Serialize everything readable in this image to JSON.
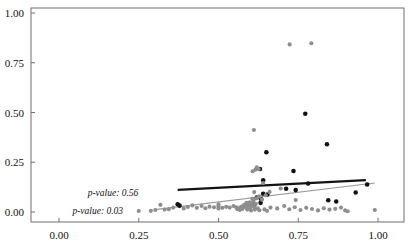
{
  "chart_data": {
    "type": "scatter",
    "title": "",
    "subtitle": "",
    "xlabel": "",
    "ylabel": "",
    "xlim": [
      -0.06,
      1.09
    ],
    "ylim": [
      -0.035,
      1.07
    ],
    "grid": false,
    "legend": "none",
    "x_ticks": [
      0.0,
      0.25,
      0.5,
      0.75,
      1.0
    ],
    "y_ticks": [
      0.0,
      0.25,
      0.5,
      0.75,
      1.0
    ],
    "x_tick_labels": [
      "0.00",
      "0.25",
      "0.50",
      "0.75",
      "1.00"
    ],
    "y_tick_labels": [
      "0.00",
      "0.25",
      "0.50",
      "0.75",
      "1.00"
    ],
    "colors": {
      "series_black": "#121212",
      "series_gray": "#8e8e8e",
      "fit_black": "#151515",
      "fit_gray": "#9a9a9a",
      "frame": "#6f6f6f",
      "text": "#101010",
      "background": "#ffffff"
    },
    "series": [
      {
        "name": "black-points",
        "marker": "circle",
        "color": "#121212",
        "size": 3.3,
        "points": [
          [
            0.65,
            0.3
          ],
          [
            0.772,
            0.494
          ],
          [
            0.84,
            0.34
          ],
          [
            0.735,
            0.206
          ],
          [
            0.63,
            0.216
          ],
          [
            0.64,
            0.159
          ],
          [
            0.781,
            0.143
          ],
          [
            0.966,
            0.138
          ],
          [
            0.712,
            0.117
          ],
          [
            0.742,
            0.11
          ],
          [
            0.93,
            0.098
          ],
          [
            0.64,
            0.092
          ],
          [
            0.653,
            0.088
          ],
          [
            0.62,
            0.073
          ],
          [
            0.634,
            0.064
          ],
          [
            0.844,
            0.059
          ],
          [
            0.869,
            0.053
          ],
          [
            0.632,
            0.046
          ],
          [
            0.603,
            0.04
          ],
          [
            0.612,
            0.036
          ],
          [
            0.585,
            0.032
          ],
          [
            0.372,
            0.039
          ],
          [
            0.378,
            0.032
          ],
          [
            0.593,
            0.028
          ],
          [
            0.573,
            0.022
          ]
        ]
      },
      {
        "name": "gray-points",
        "marker": "circle",
        "color": "#8e8e8e",
        "size": 3.0,
        "points": [
          [
            0.723,
            0.842
          ],
          [
            0.791,
            0.848
          ],
          [
            0.611,
            0.412
          ],
          [
            0.62,
            0.224
          ],
          [
            0.607,
            0.205
          ],
          [
            0.616,
            0.213
          ],
          [
            0.626,
            0.216
          ],
          [
            0.64,
            0.146
          ],
          [
            0.695,
            0.118
          ],
          [
            0.66,
            0.101
          ],
          [
            0.612,
            0.1
          ],
          [
            0.648,
            0.084
          ],
          [
            0.628,
            0.079
          ],
          [
            0.619,
            0.069
          ],
          [
            0.606,
            0.066
          ],
          [
            0.636,
            0.062
          ],
          [
            0.742,
            0.06
          ],
          [
            0.61,
            0.056
          ],
          [
            0.598,
            0.049
          ],
          [
            0.588,
            0.046
          ],
          [
            0.604,
            0.044
          ],
          [
            0.617,
            0.041
          ],
          [
            0.585,
            0.038
          ],
          [
            0.596,
            0.035
          ],
          [
            0.578,
            0.033
          ],
          [
            0.608,
            0.03
          ],
          [
            0.591,
            0.028
          ],
          [
            0.582,
            0.025
          ],
          [
            0.571,
            0.026
          ],
          [
            0.6,
            0.022
          ],
          [
            0.613,
            0.021
          ],
          [
            0.623,
            0.019
          ],
          [
            0.565,
            0.02
          ],
          [
            0.556,
            0.024
          ],
          [
            0.547,
            0.03
          ],
          [
            0.535,
            0.022
          ],
          [
            0.524,
            0.026
          ],
          [
            0.512,
            0.021
          ],
          [
            0.5,
            0.028
          ],
          [
            0.5,
            0.018
          ],
          [
            0.5,
            0.038
          ],
          [
            0.486,
            0.024
          ],
          [
            0.472,
            0.027
          ],
          [
            0.459,
            0.019
          ],
          [
            0.447,
            0.03
          ],
          [
            0.432,
            0.021
          ],
          [
            0.418,
            0.033
          ],
          [
            0.404,
            0.025
          ],
          [
            0.391,
            0.018
          ],
          [
            0.358,
            0.022
          ],
          [
            0.344,
            0.014
          ],
          [
            0.331,
            0.012
          ],
          [
            0.318,
            0.036
          ],
          [
            0.302,
            0.01
          ],
          [
            0.288,
            0.006
          ],
          [
            0.25,
            0.005
          ],
          [
            0.663,
            0.022
          ],
          [
            0.684,
            0.018
          ],
          [
            0.706,
            0.03
          ],
          [
            0.722,
            0.014
          ],
          [
            0.739,
            0.024
          ],
          [
            0.757,
            0.01
          ],
          [
            0.775,
            0.021
          ],
          [
            0.793,
            0.015
          ],
          [
            0.812,
            0.008
          ],
          [
            0.83,
            0.019
          ],
          [
            0.848,
            0.012
          ],
          [
            0.866,
            0.016
          ],
          [
            0.884,
            0.022
          ],
          [
            0.897,
            0.008
          ],
          [
            0.905,
            0.004
          ],
          [
            0.99,
            0.01
          ],
          [
            0.559,
            0.014
          ],
          [
            0.567,
            0.01
          ],
          [
            0.575,
            0.015
          ],
          [
            0.59,
            0.012
          ],
          [
            0.602,
            0.008
          ],
          [
            0.614,
            0.012
          ],
          [
            0.628,
            0.009
          ],
          [
            0.644,
            0.013
          ],
          [
            0.652,
            0.006
          ]
        ]
      }
    ],
    "fit_lines": [
      {
        "name": "black-regression-line",
        "color": "#151212",
        "width": 2.2,
        "x_start": 0.372,
        "y_start": 0.111,
        "x_end": 0.962,
        "y_end": 0.16,
        "p_value": "0.56",
        "label": "p-value: 0.56"
      },
      {
        "name": "gray-regression-line",
        "color": "#9a9a9a",
        "width": 1.1,
        "x_start": 0.3,
        "y_start": 0.012,
        "x_end": 0.99,
        "y_end": 0.146,
        "p_value": "0.03",
        "label": "p-value: 0.03"
      }
    ],
    "annotations": [
      {
        "name": "p-value-black-annotation",
        "text": "p-value: 0.56",
        "x": 0.09,
        "y": 0.098,
        "style": "italic"
      },
      {
        "name": "p-value-gray-annotation",
        "text": "p-value: 0.03",
        "x": 0.042,
        "y": 0.008,
        "style": "italic"
      }
    ]
  }
}
